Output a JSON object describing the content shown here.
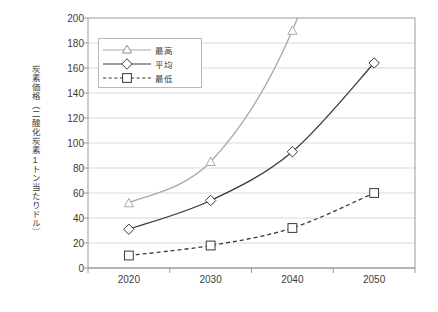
{
  "chart_data": {
    "type": "line",
    "title": "",
    "xlabel": "",
    "ylabel": "炭素価格（二酸化炭素1トン当たりドル）",
    "categories": [
      "2020",
      "2030",
      "2040",
      "2050"
    ],
    "ylim": [
      0,
      200
    ],
    "y_ticks": [
      0,
      20,
      40,
      60,
      80,
      100,
      120,
      140,
      160,
      180,
      200
    ],
    "y_tick_labels": [
      "0",
      "20",
      "40",
      "60",
      "80",
      "100",
      "120",
      "140",
      "160",
      "180",
      "200"
    ],
    "grid": "horizontal",
    "legend_position": "top-left-inside",
    "series": [
      {
        "name": "最高",
        "values": [
          52,
          85,
          190,
          null
        ],
        "marker": "triangle",
        "line_style": "solid",
        "color": "#a8a8a8",
        "note": "2050 value exceeds axis maximum; line runs off the top of the plot"
      },
      {
        "name": "平均",
        "values": [
          31,
          54,
          93,
          164
        ],
        "marker": "diamond",
        "line_style": "solid",
        "color": "#3a3a3a"
      },
      {
        "name": "最低",
        "values": [
          10,
          18,
          32,
          60
        ],
        "marker": "square",
        "line_style": "dashed",
        "color": "#3a3a3a"
      }
    ]
  },
  "legend": {
    "items": [
      {
        "label": "最高"
      },
      {
        "label": "平均"
      },
      {
        "label": "最低"
      }
    ]
  },
  "colors": {
    "max_series": "#a8a8a8",
    "avg_series": "#3a3a3a",
    "min_series": "#3a3a3a",
    "gridline": "#d9d9d9",
    "axis": "#9a9a9a",
    "text": "#3c3c3c",
    "background": "#ffffff"
  }
}
